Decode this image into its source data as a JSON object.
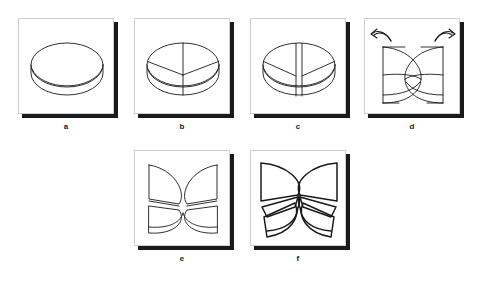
{
  "figure": {
    "background_color": "#ffffff",
    "stroke_color": "#1a1a1a",
    "panel_border_color": "#cfcfcf",
    "shadow_color": "#1a1a1a",
    "panel_size_px": 96,
    "panels": [
      {
        "id": "a",
        "caption": "a",
        "description": "whole cylindrical disc seen in oblique view, top ellipse plus side wall"
      },
      {
        "id": "b",
        "caption": "b",
        "description": "disc with Y shaped scoring on the top face, vertical line continues down the front wall"
      },
      {
        "id": "c",
        "caption": "c",
        "description": "disc cut through along the vertical line, two parallel cut faces separated by a gap"
      },
      {
        "id": "d",
        "caption": "d",
        "description": "two half discs swung open about the vertical cut, curved rotation arrows at the top"
      },
      {
        "id": "e",
        "caption": "e",
        "description": "halves opened wider and each split along the oblique score into four butterfly pieces"
      },
      {
        "id": "f",
        "caption": "f",
        "description": "final butterfly arrangement with all four wedges splayed from a single centre point, bold outlines"
      }
    ],
    "annotations": {
      "left_arrow": "curved-rotation-arrow-left",
      "right_arrow": "curved-rotation-arrow-right"
    }
  }
}
